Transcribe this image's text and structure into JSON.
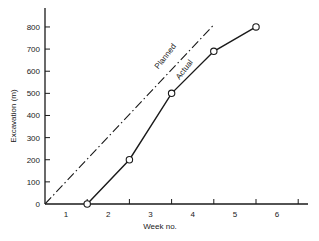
{
  "chart_data": {
    "type": "line",
    "title": "",
    "xlabel": "Week no.",
    "ylabel": "Excavation (m)",
    "xlim": [
      0,
      6.2
    ],
    "ylim": [
      0,
      880
    ],
    "x_ticks": [
      1,
      2,
      3,
      4,
      5,
      6
    ],
    "x_tick_labels": [
      {
        "label": "1",
        "pos": 0.5
      },
      {
        "label": "2",
        "pos": 1.5
      },
      {
        "label": "3",
        "pos": 2.5
      },
      {
        "label": "4",
        "pos": 3.5
      },
      {
        "label": "5",
        "pos": 4.5
      },
      {
        "label": "6",
        "pos": 5.5
      }
    ],
    "y_ticks": [
      0,
      100,
      200,
      300,
      400,
      500,
      600,
      700,
      800
    ],
    "y_tick_labels": [
      "0",
      "100",
      "200",
      "300",
      "400",
      "500",
      "600",
      "700",
      "800"
    ],
    "grid": false,
    "legend": "inline labels along lines",
    "series": [
      {
        "name": "Planned",
        "style": "dash-dot",
        "markers": false,
        "x": [
          0,
          4
        ],
        "y": [
          0,
          810
        ],
        "label_pos": {
          "x": 2.9,
          "y": 660
        }
      },
      {
        "name": "Actual",
        "style": "solid",
        "markers": true,
        "x": [
          1,
          2,
          3,
          4,
          5
        ],
        "y": [
          0,
          200,
          500,
          690,
          800
        ],
        "label_pos": {
          "x": 3.35,
          "y": 600
        }
      }
    ]
  }
}
